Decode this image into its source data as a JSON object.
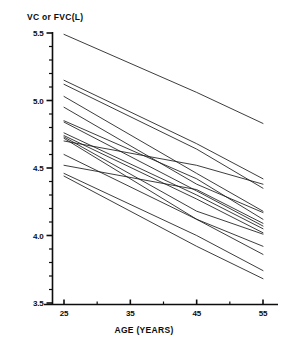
{
  "figure": {
    "background": "#ffffff",
    "line_color": "#1a1a1a",
    "axis_color": "#0d0d0d"
  },
  "labels": {
    "ylabel": "VC or FVC(L)",
    "xlabel": "AGE (YEARS)"
  },
  "axes": {
    "y_major_labels": [
      "5.5",
      "5.0",
      "4.5",
      "4.0",
      "3.5"
    ],
    "x_major_labels": [
      "25",
      "35",
      "45",
      "55"
    ]
  },
  "chart_data": {
    "type": "line",
    "title": "",
    "xlabel": "AGE (YEARS)",
    "ylabel": "VC or FVC(L)",
    "xlim": [
      22,
      58
    ],
    "ylim": [
      3.5,
      5.5
    ],
    "xticks": [
      25,
      35,
      45,
      55
    ],
    "yticks": [
      3.5,
      4.0,
      4.5,
      5.0,
      5.5
    ],
    "y_minor_tick_step": 0.1,
    "grid": false,
    "legend": "none",
    "x": [
      25,
      45,
      55
    ],
    "series": [
      {
        "name": "subject-1",
        "values": [
          5.49,
          5.06,
          4.83
        ]
      },
      {
        "name": "subject-2",
        "values": [
          5.15,
          4.68,
          4.42
        ]
      },
      {
        "name": "subject-3",
        "values": [
          5.12,
          4.64,
          4.35
        ]
      },
      {
        "name": "subject-4",
        "values": [
          5.03,
          4.46,
          4.18
        ]
      },
      {
        "name": "subject-5",
        "values": [
          4.95,
          4.38,
          4.17
        ]
      },
      {
        "name": "subject-6",
        "values": [
          4.85,
          4.42,
          4.12
        ]
      },
      {
        "name": "subject-7",
        "values": [
          4.84,
          4.33,
          4.07
        ]
      },
      {
        "name": "subject-8",
        "values": [
          4.76,
          4.3,
          4.05
        ]
      },
      {
        "name": "subject-9",
        "values": [
          4.74,
          4.27,
          4.02
        ]
      },
      {
        "name": "subject-10",
        "values": [
          4.73,
          4.18,
          4.01
        ]
      },
      {
        "name": "subject-11",
        "values": [
          4.72,
          4.12,
          3.92
        ]
      },
      {
        "name": "subject-12",
        "values": [
          4.7,
          4.52,
          4.38
        ]
      },
      {
        "name": "subject-13",
        "values": [
          4.6,
          4.12,
          3.86
        ]
      },
      {
        "name": "subject-14",
        "values": [
          4.52,
          4.34,
          4.09
        ]
      },
      {
        "name": "subject-15",
        "values": [
          4.46,
          4.0,
          3.74
        ]
      },
      {
        "name": "subject-16",
        "values": [
          4.44,
          3.92,
          3.68
        ]
      }
    ]
  }
}
